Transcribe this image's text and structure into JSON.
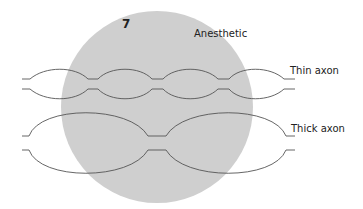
{
  "figure": {
    "number": "7",
    "labels": {
      "anesthetic": "Anesthetic",
      "thin_axon": "Thin axon",
      "thick_axon": "Thick axon"
    },
    "colors": {
      "background": "#ffffff",
      "anesthetic_region": "#cfcfcf",
      "axon_stroke": "#555555",
      "text": "#222222"
    }
  }
}
